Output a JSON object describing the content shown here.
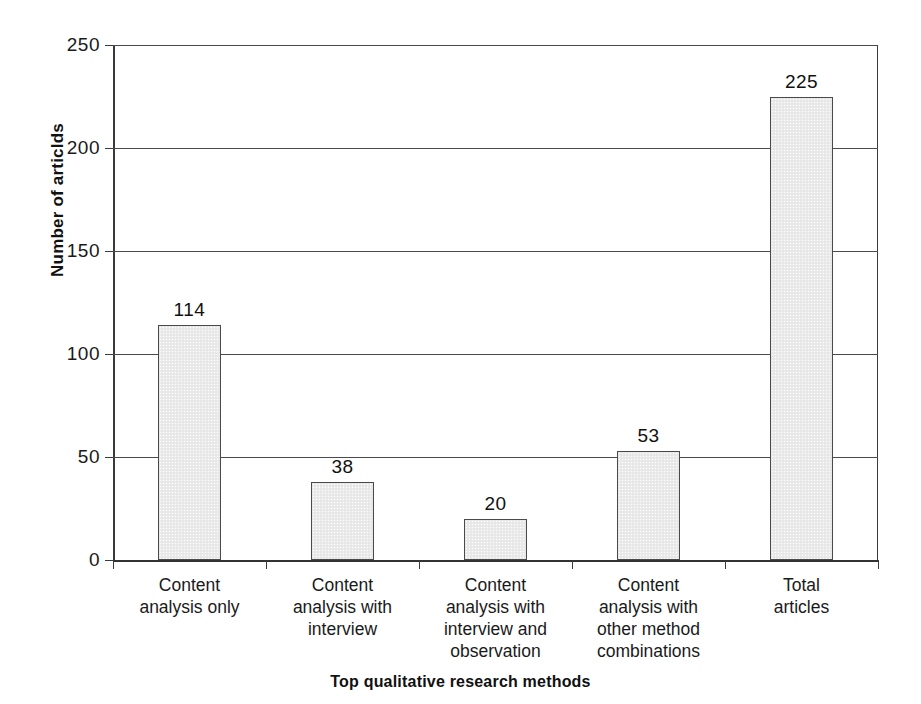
{
  "chart_data": {
    "type": "bar",
    "title": "",
    "xlabel": "Top qualitative research methods",
    "ylabel": "Number of articlds",
    "categories": [
      "Content\nanalysis only",
      "Content\nanalysis with\ninterview",
      "Content\nanalysis with\ninterview and\nobservation",
      "Content\nanalysis with\nother method\ncombinations",
      "Total articles"
    ],
    "values": [
      114,
      38,
      20,
      53,
      225
    ],
    "value_labels": [
      "114",
      "38",
      "20",
      "53",
      "225"
    ],
    "ylim": [
      0,
      250
    ],
    "ytick_values": [
      0,
      50,
      100,
      150,
      200,
      250
    ],
    "ytick_labels": [
      "0",
      "50",
      "100",
      "150",
      "200",
      "250"
    ],
    "grid": true,
    "legend": "none",
    "bar_fill_color": "#eaeaea",
    "bar_border_color": "#4a4a4a",
    "axis_color": "#3a3a3a",
    "text_color": "#1a1a1a"
  }
}
